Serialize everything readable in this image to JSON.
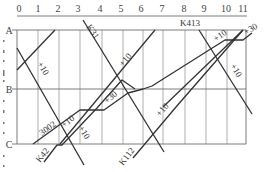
{
  "diagram": {
    "type": "train-schedule-graph",
    "top_axis": {
      "ticks": [
        "0",
        "1",
        "2",
        "3",
        "4",
        "5",
        "6",
        "7",
        "8",
        "9",
        "10",
        "11"
      ]
    },
    "stations": [
      "A",
      "B",
      "C"
    ],
    "train_labels": {
      "k31": "K31",
      "k413": "K413",
      "k42": "K42",
      "k112": "K112",
      "t3002": "3002"
    },
    "offset_labels": {
      "left_upper": "+10",
      "left_lower": "+10",
      "center_upper": "+10",
      "center_lower": "+10",
      "k42_mid": "+30",
      "right_top": "+10",
      "right_top_end": "+30",
      "right_mid": "+10",
      "t3002_mid": "+10"
    },
    "colors": {
      "line": "#333333",
      "grid": "#9a9a9a",
      "frame": "#6e6e6e",
      "text": "#444444"
    }
  }
}
